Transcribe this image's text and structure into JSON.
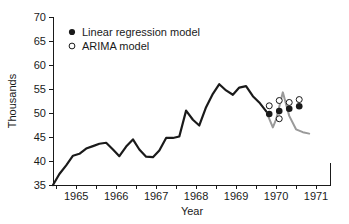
{
  "chart_data": {
    "type": "line",
    "title": "",
    "xlabel": "Year",
    "ylabel": "Thousands",
    "xlim": [
      1964.42,
      1971.35
    ],
    "ylim": [
      35,
      70
    ],
    "grid": false,
    "legend_position": "top-left",
    "y_ticks": [
      35,
      40,
      45,
      50,
      55,
      60,
      65,
      70
    ],
    "y_tick_labels": [
      "35",
      "40",
      "45",
      "50",
      "55",
      "60",
      "65",
      "70"
    ],
    "x_ticks": [
      1965,
      1966,
      1967,
      1968,
      1969,
      1970,
      1971
    ],
    "x_tick_labels": [
      "1965",
      "1966",
      "1967",
      "1968",
      "1969",
      "1970",
      "1971"
    ],
    "x_minor_ticks": [
      1964.5,
      1965.5,
      1966.5,
      1967.5,
      1968.5,
      1969.5,
      1970.5
    ],
    "series": [
      {
        "name": "Observed series",
        "type": "line",
        "color": "#1a1a1a",
        "linewidth": 2.2,
        "x": [
          1964.42,
          1964.58,
          1964.75,
          1964.92,
          1965.08,
          1965.25,
          1965.42,
          1965.58,
          1965.75,
          1965.92,
          1966.08,
          1966.25,
          1966.42,
          1966.58,
          1966.75,
          1966.92,
          1967.08,
          1967.25,
          1967.42,
          1967.58,
          1967.75,
          1967.92,
          1968.08,
          1968.25,
          1968.42,
          1968.58,
          1968.75,
          1968.92,
          1969.08,
          1969.25,
          1969.42,
          1969.58,
          1969.75
        ],
        "y": [
          35.0,
          37.3,
          39.1,
          41.1,
          41.5,
          42.6,
          43.1,
          43.6,
          43.8,
          42.4,
          41.0,
          43.0,
          44.5,
          42.4,
          40.9,
          40.8,
          42.2,
          44.8,
          44.8,
          45.1,
          50.5,
          48.6,
          47.4,
          51.2,
          54.0,
          56.0,
          54.7,
          53.8,
          55.3,
          55.6,
          53.5,
          52.2,
          50.4
        ]
      },
      {
        "name": "Forecast band line",
        "type": "line",
        "color": "#9a9a9a",
        "linewidth": 2.0,
        "x": [
          1969.75,
          1969.92,
          1970.0,
          1970.17,
          1970.33,
          1970.5,
          1970.67,
          1970.83
        ],
        "y": [
          50.4,
          47.0,
          48.6,
          54.3,
          49.4,
          46.6,
          46.0,
          45.7
        ]
      },
      {
        "name": "Linear regression model",
        "type": "scatter",
        "marker": "filled-circle",
        "color": "#1a1a1a",
        "x": [
          1969.83,
          1970.08,
          1970.33,
          1970.58
        ],
        "y": [
          49.8,
          50.4,
          50.9,
          51.4
        ]
      },
      {
        "name": "ARIMA model",
        "type": "scatter",
        "marker": "open-circle",
        "color": "#1a1a1a",
        "x": [
          1969.83,
          1970.08,
          1970.08,
          1970.33,
          1970.58
        ],
        "y": [
          51.5,
          48.8,
          52.6,
          52.2,
          52.8
        ]
      }
    ],
    "legend": [
      {
        "label": "Linear regression model",
        "marker": "filled-circle"
      },
      {
        "label": "ARIMA model",
        "marker": "open-circle"
      }
    ]
  },
  "axes": {
    "y_title": "Thousands",
    "x_title": "Year",
    "y_labels": [
      "70",
      "65",
      "60",
      "55",
      "50",
      "45",
      "40",
      "35"
    ],
    "x_labels": [
      "1965",
      "1966",
      "1967",
      "1968",
      "1969",
      "1970",
      "1971"
    ]
  },
  "legend": {
    "linear_label": "Linear regression model",
    "arima_label": "ARIMA model"
  },
  "colors": {
    "observed": "#1a1a1a",
    "forecast": "#9a9a9a",
    "axis": "#1a1a1a",
    "background": "#ffffff"
  }
}
